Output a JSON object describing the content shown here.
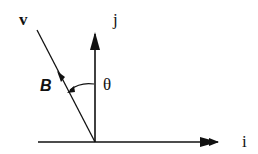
{
  "diagram": {
    "labels": {
      "v": "v",
      "j": "j",
      "i": "i",
      "theta": "θ",
      "B": "B"
    }
  }
}
